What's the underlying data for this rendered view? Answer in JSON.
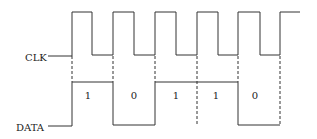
{
  "diagram": {
    "type": "timing-diagram",
    "signals": [
      {
        "name": "clk",
        "label": "CLK"
      },
      {
        "name": "data",
        "label": "DATA"
      }
    ],
    "bits": [
      "1",
      "0",
      "1",
      "1",
      "0"
    ]
  }
}
